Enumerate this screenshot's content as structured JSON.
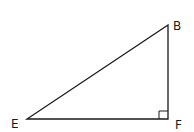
{
  "diagram": {
    "type": "right-triangle",
    "vertices": [
      {
        "label": "B",
        "x": 168,
        "y": 25
      },
      {
        "label": "E",
        "x": 27,
        "y": 119
      },
      {
        "label": "F",
        "x": 168,
        "y": 119
      }
    ],
    "right_angle_at": "F",
    "stroke_color": "#1a1a1a",
    "labels": {
      "b": "B",
      "e": "E",
      "f": "F"
    }
  }
}
